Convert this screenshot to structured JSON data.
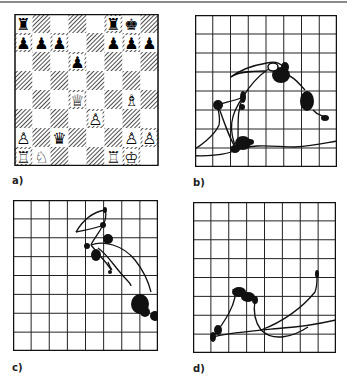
{
  "figure": {
    "panels": [
      {
        "id": "a",
        "label": "a)",
        "type": "chess-position"
      },
      {
        "id": "b",
        "label": "b)",
        "type": "eye-movement-trace"
      },
      {
        "id": "c",
        "label": "c)",
        "type": "eye-movement-trace"
      },
      {
        "id": "d",
        "label": "d)",
        "type": "eye-movement-trace"
      }
    ],
    "grid_size": 8
  },
  "chess_position": {
    "pieces": [
      {
        "square": "a8",
        "glyph": "♜",
        "name": "black-rook"
      },
      {
        "square": "f8",
        "glyph": "♜",
        "name": "black-rook"
      },
      {
        "square": "g8",
        "glyph": "♚",
        "name": "black-king"
      },
      {
        "square": "a7",
        "glyph": "♟",
        "name": "black-pawn"
      },
      {
        "square": "b7",
        "glyph": "♟",
        "name": "black-pawn"
      },
      {
        "square": "c7",
        "glyph": "♟",
        "name": "black-pawn"
      },
      {
        "square": "f7",
        "glyph": "♟",
        "name": "black-pawn"
      },
      {
        "square": "g7",
        "glyph": "♟",
        "name": "black-pawn"
      },
      {
        "square": "h7",
        "glyph": "♟",
        "name": "black-pawn"
      },
      {
        "square": "d6",
        "glyph": "♟",
        "name": "black-pawn"
      },
      {
        "square": "d4",
        "glyph": "♕",
        "name": "white-queen"
      },
      {
        "square": "g4",
        "glyph": "♗",
        "name": "white-bishop"
      },
      {
        "square": "e3",
        "glyph": "♙",
        "name": "white-pawn"
      },
      {
        "square": "a2",
        "glyph": "♙",
        "name": "white-pawn"
      },
      {
        "square": "c2",
        "glyph": "♛",
        "name": "black-queen"
      },
      {
        "square": "g2",
        "glyph": "♙",
        "name": "white-pawn"
      },
      {
        "square": "h2",
        "glyph": "♙",
        "name": "white-pawn"
      },
      {
        "square": "a1",
        "glyph": "♖",
        "name": "white-rook"
      },
      {
        "square": "b1",
        "glyph": "♘",
        "name": "white-knight"
      },
      {
        "square": "f1",
        "glyph": "♖",
        "name": "white-rook"
      },
      {
        "square": "g1",
        "glyph": "♔",
        "name": "white-king"
      }
    ]
  }
}
